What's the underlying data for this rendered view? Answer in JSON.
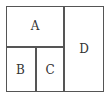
{
  "diagram": {
    "regions": [
      {
        "id": "A",
        "label": "A"
      },
      {
        "id": "B",
        "label": "B"
      },
      {
        "id": "C",
        "label": "C"
      },
      {
        "id": "D",
        "label": "D"
      }
    ]
  }
}
